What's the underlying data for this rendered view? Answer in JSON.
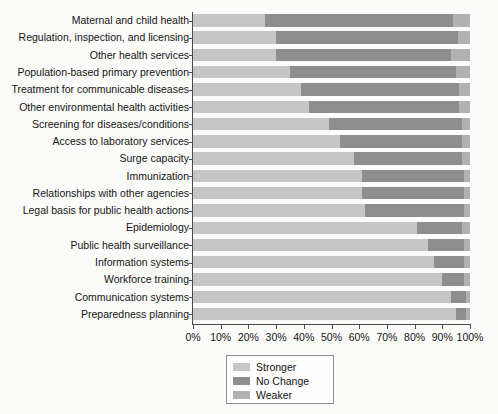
{
  "chart_data": {
    "type": "bar",
    "orientation": "horizontal",
    "stacked": true,
    "stack_mode": "percent",
    "title": "",
    "xlabel": "",
    "ylabel": "",
    "xlim": [
      0,
      100
    ],
    "grid": false,
    "legend_position": "bottom-center",
    "tick_labels": [
      "0%",
      "10%",
      "20%",
      "30%",
      "40%",
      "50%",
      "60%",
      "70%",
      "80%",
      "90%",
      "100%"
    ],
    "tick_values": [
      0,
      10,
      20,
      30,
      40,
      50,
      60,
      70,
      80,
      90,
      100
    ],
    "categories": [
      "Maternal and child health",
      "Regulation, inspection, and licensing",
      "Other health services",
      "Population-based primary prevention",
      "Treatment for communicable diseases",
      "Other environmental health activities",
      "Screening for diseases/conditions",
      "Access to laboratory services",
      "Surge capacity",
      "Immunization",
      "Relationships with other agencies",
      "Legal basis for public health actions",
      "Epidemiology",
      "Public health surveillance",
      "Information systems",
      "Workforce training",
      "Communication systems",
      "Preparedness planning"
    ],
    "series": [
      {
        "name": "Stronger",
        "color": "#c6c6c6",
        "values": [
          26,
          30,
          30,
          35,
          39,
          42,
          49,
          53,
          58,
          61,
          61,
          62,
          81,
          85,
          87,
          90,
          93,
          95
        ]
      },
      {
        "name": "No Change",
        "color": "#8e8e8e",
        "values": [
          68,
          65.5,
          63,
          60,
          57,
          54,
          48,
          44,
          39,
          37,
          37,
          36,
          16,
          13,
          11,
          8,
          5.5,
          3.5
        ]
      },
      {
        "name": "Weaker",
        "color": "#b1b1b1",
        "values": [
          6,
          4.5,
          7,
          5,
          4,
          4,
          3,
          3,
          3,
          2,
          2,
          2,
          3,
          2,
          2,
          2,
          1.5,
          1.5
        ]
      }
    ]
  },
  "legend": {
    "items": [
      {
        "label": "Stronger",
        "color": "#c6c6c6"
      },
      {
        "label": "No Change",
        "color": "#8e8e8e"
      },
      {
        "label": "Weaker",
        "color": "#b1b1b1"
      }
    ]
  }
}
